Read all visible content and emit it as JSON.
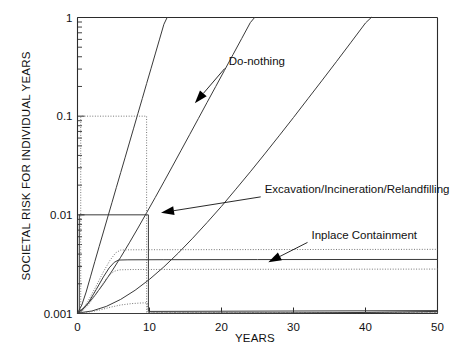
{
  "chart_data": {
    "type": "line",
    "title": "",
    "xlabel": "YEARS",
    "ylabel": "SOCIETAL RISK FOR INDIVIDUAL YEARS",
    "yscale": "log",
    "xscale": "linear",
    "xlim": [
      0,
      50
    ],
    "ylim": [
      0.001,
      1
    ],
    "xticks": [
      0,
      10,
      20,
      30,
      40,
      50
    ],
    "xtick_labels": [
      "0",
      "10",
      "20",
      "30",
      "40",
      "50"
    ],
    "yticks": [
      0.001,
      0.01,
      0.1,
      1
    ],
    "ytick_labels": [
      "0.001",
      "0.01",
      "0.1",
      "1"
    ],
    "grid": false,
    "legend": "none",
    "annotations": [
      {
        "text": "Do-nothing",
        "text_x": 21.0,
        "text_y": 0.33,
        "arrow_to_x": 16.3,
        "arrow_to_y": 0.135
      },
      {
        "text": "Excavation/Incineration/Relandfilling",
        "text_x": 26.0,
        "text_y": 0.0165,
        "arrow_to_x": 11.6,
        "arrow_to_y": 0.0105
      },
      {
        "text": "Inplace Containment",
        "text_x": 32.5,
        "text_y": 0.0057,
        "arrow_to_x": 26.5,
        "arrow_to_y": 0.0033
      }
    ],
    "series": [
      {
        "name": "do-nothing-rising-curve-1",
        "style": "solid",
        "points": [
          [
            0.0,
            0.00101
          ],
          [
            0.6,
            0.00122
          ],
          [
            1.2,
            0.00165
          ],
          [
            1.8,
            0.00235
          ],
          [
            2.4,
            0.00335
          ],
          [
            3.0,
            0.00475
          ],
          [
            3.6,
            0.0067
          ],
          [
            4.2,
            0.0095
          ],
          [
            4.8,
            0.0134
          ],
          [
            5.4,
            0.019
          ],
          [
            6.0,
            0.0268
          ],
          [
            6.6,
            0.0378
          ],
          [
            7.2,
            0.0535
          ],
          [
            7.8,
            0.0756
          ],
          [
            8.4,
            0.107
          ],
          [
            9.0,
            0.151
          ],
          [
            9.6,
            0.214
          ],
          [
            10.2,
            0.302
          ],
          [
            10.8,
            0.427
          ],
          [
            11.4,
            0.604
          ],
          [
            12.0,
            0.854
          ],
          [
            12.45,
            1.0
          ]
        ]
      },
      {
        "name": "do-nothing-rising-curve-2",
        "style": "solid",
        "points": [
          [
            0.0,
            0.00101
          ],
          [
            1.2,
            0.0012
          ],
          [
            2.4,
            0.00152
          ],
          [
            3.6,
            0.002
          ],
          [
            4.8,
            0.0027
          ],
          [
            6.0,
            0.00372
          ],
          [
            7.2,
            0.0052
          ],
          [
            8.4,
            0.00735
          ],
          [
            9.6,
            0.0105
          ],
          [
            10.8,
            0.015
          ],
          [
            12.0,
            0.0216
          ],
          [
            13.2,
            0.0312
          ],
          [
            14.4,
            0.0452
          ],
          [
            15.6,
            0.0655
          ],
          [
            16.8,
            0.095
          ],
          [
            18.0,
            0.138
          ],
          [
            19.2,
            0.2
          ],
          [
            20.4,
            0.29
          ],
          [
            21.6,
            0.421
          ],
          [
            22.8,
            0.611
          ],
          [
            24.0,
            0.887
          ],
          [
            24.6,
            1.0
          ]
        ]
      },
      {
        "name": "inplace-containment-rising-curve",
        "style": "solid",
        "points": [
          [
            0.0,
            0.00101
          ],
          [
            2.0,
            0.00106
          ],
          [
            4.0,
            0.00118
          ],
          [
            6.0,
            0.00139
          ],
          [
            8.0,
            0.00172
          ],
          [
            10.0,
            0.00222
          ],
          [
            12.0,
            0.00297
          ],
          [
            14.0,
            0.0041
          ],
          [
            16.0,
            0.0058
          ],
          [
            18.0,
            0.00836
          ],
          [
            20.0,
            0.0122
          ],
          [
            22.0,
            0.0182
          ],
          [
            24.0,
            0.0273
          ],
          [
            26.0,
            0.0414
          ],
          [
            28.0,
            0.0632
          ],
          [
            30.0,
            0.097
          ],
          [
            32.0,
            0.15
          ],
          [
            34.0,
            0.232
          ],
          [
            36.0,
            0.36
          ],
          [
            38.0,
            0.562
          ],
          [
            40.0,
            0.88
          ],
          [
            40.8,
            1.0
          ]
        ]
      },
      {
        "name": "dotted-box-upper-0.1",
        "style": "dotted",
        "points": [
          [
            0.45,
            0.00102
          ],
          [
            0.45,
            0.1
          ],
          [
            9.6,
            0.1
          ],
          [
            9.6,
            0.00102
          ],
          [
            50.0,
            0.00102
          ]
        ]
      },
      {
        "name": "solid-step-0.01",
        "style": "solid",
        "points": [
          [
            0.25,
            0.00101
          ],
          [
            0.25,
            0.01
          ],
          [
            9.85,
            0.01
          ],
          [
            9.85,
            0.00105
          ],
          [
            50.0,
            0.00107
          ]
        ]
      },
      {
        "name": "dotted-plateau-upper-0.0044",
        "style": "dotted",
        "points": [
          [
            0.35,
            0.00101
          ],
          [
            1.5,
            0.00135
          ],
          [
            2.6,
            0.0019
          ],
          [
            3.6,
            0.00265
          ],
          [
            4.5,
            0.00345
          ],
          [
            5.3,
            0.00412
          ],
          [
            6.0,
            0.0044
          ],
          [
            7.0,
            0.00442
          ],
          [
            10.0,
            0.00443
          ],
          [
            20.0,
            0.00444
          ],
          [
            50.0,
            0.00447
          ]
        ]
      },
      {
        "name": "solid-plateau-0.0035",
        "style": "solid",
        "points": [
          [
            0.3,
            0.00101
          ],
          [
            1.5,
            0.00128
          ],
          [
            2.6,
            0.00175
          ],
          [
            3.6,
            0.00235
          ],
          [
            4.4,
            0.0029
          ],
          [
            5.1,
            0.0033
          ],
          [
            5.7,
            0.00348
          ],
          [
            7.0,
            0.0035
          ],
          [
            12.0,
            0.00351
          ],
          [
            25.0,
            0.00352
          ],
          [
            50.0,
            0.00353
          ]
        ]
      },
      {
        "name": "dotted-plateau-lower-0.0028",
        "style": "dotted",
        "points": [
          [
            0.4,
            0.00101
          ],
          [
            1.5,
            0.00122
          ],
          [
            2.6,
            0.00158
          ],
          [
            3.6,
            0.00205
          ],
          [
            4.4,
            0.00245
          ],
          [
            5.1,
            0.00268
          ],
          [
            5.8,
            0.00277
          ],
          [
            7.5,
            0.00279
          ],
          [
            15.0,
            0.0028
          ],
          [
            50.0,
            0.00282
          ]
        ]
      },
      {
        "name": "dotted-baseline-step",
        "style": "dotted",
        "points": [
          [
            0.5,
            0.00101
          ],
          [
            1.8,
            0.00104
          ],
          [
            3.2,
            0.00109
          ],
          [
            4.6,
            0.00116
          ],
          [
            6.0,
            0.00122
          ],
          [
            7.5,
            0.00126
          ],
          [
            9.0,
            0.00128
          ],
          [
            9.7,
            0.00128
          ],
          [
            9.8,
            0.00102
          ],
          [
            50.0,
            0.00102
          ]
        ]
      },
      {
        "name": "solid-baseline-tail",
        "style": "solid",
        "points": [
          [
            0.0,
            0.001
          ],
          [
            10.0,
            0.001
          ],
          [
            20.0,
            0.001005
          ],
          [
            30.0,
            0.00101
          ],
          [
            40.0,
            0.001025
          ],
          [
            50.0,
            0.00105
          ]
        ]
      }
    ]
  }
}
